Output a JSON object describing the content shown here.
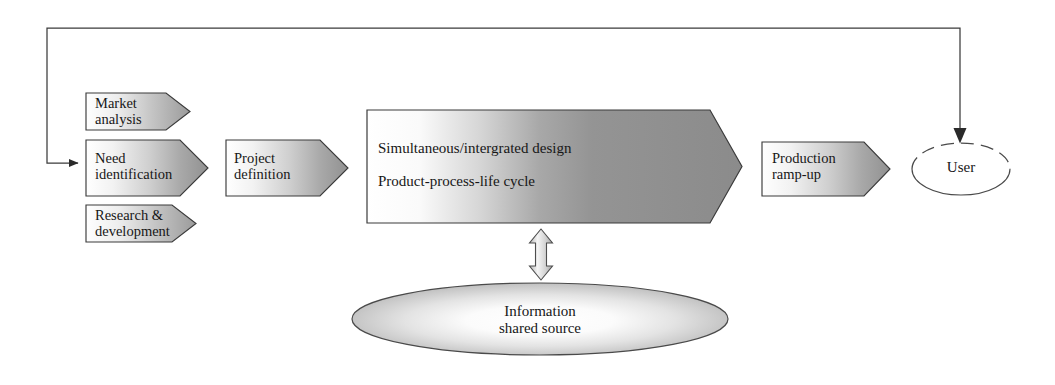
{
  "diagram": {
    "type": "process-flow",
    "colors": {
      "stroke": "#3b3b3b",
      "text": "#171717",
      "gradient_light": "#ffffff",
      "gradient_mid": "#d8d8d8",
      "gradient_dark": "#8f8f8f",
      "center_dark": "#8c8c8c",
      "arrow_fill": "#2a2a2a",
      "page_background": "#ffffff"
    },
    "inputs": [
      {
        "id": "market-analysis",
        "label": "Market\nanalysis"
      },
      {
        "id": "need-identification",
        "label": "Need\nidentification"
      },
      {
        "id": "research-development",
        "label": "Research &\ndevelopment"
      }
    ],
    "stages": [
      {
        "id": "project-definition",
        "label": "Project\ndefinition"
      },
      {
        "id": "production-ramp-up",
        "label": "Production\nramp-up"
      }
    ],
    "center_block": {
      "id": "simultaneous-integrated-design",
      "line1": "Simultaneous/intergrated design",
      "line2": "Product-process-life cycle"
    },
    "information_source": {
      "id": "information-shared-source",
      "line1": "Information",
      "line2": "shared source"
    },
    "user_node": {
      "id": "user",
      "label": "User"
    },
    "connectors": {
      "feedback_loop": "feedback loop from user back to need identification",
      "bidirectional": "bidirectional link between design block and shared information source"
    }
  }
}
